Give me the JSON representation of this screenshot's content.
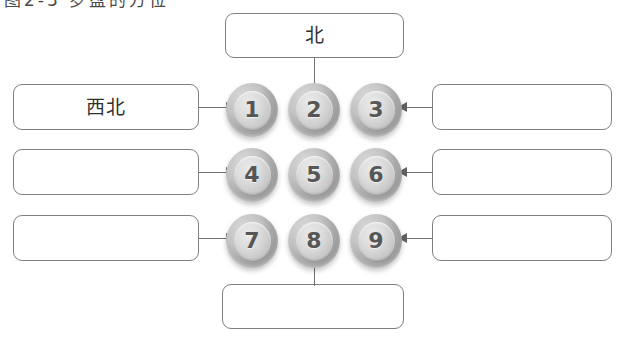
{
  "page": {
    "cut_off_header_text": "图2-3 罗盘的方位",
    "background_color": "#ffffff"
  },
  "colors": {
    "box_border": "#7d7f82",
    "connector": "#6f7173",
    "arrow_head": "#5f6163",
    "coin_outer": "#a8a8a8",
    "coin_inner": "#dcdcdc",
    "coin_number": "#565656",
    "text": "#2f2f2f"
  },
  "diagram": {
    "title": "",
    "type": "annotated-grid",
    "grid": {
      "rows": 3,
      "cols": 3,
      "cells": [
        {
          "id": "cell-1",
          "number": "1",
          "row": 1,
          "col": 1
        },
        {
          "id": "cell-2",
          "number": "2",
          "row": 1,
          "col": 2
        },
        {
          "id": "cell-3",
          "number": "3",
          "row": 1,
          "col": 3
        },
        {
          "id": "cell-4",
          "number": "4",
          "row": 2,
          "col": 1
        },
        {
          "id": "cell-5",
          "number": "5",
          "row": 2,
          "col": 2
        },
        {
          "id": "cell-6",
          "number": "6",
          "row": 2,
          "col": 3
        },
        {
          "id": "cell-7",
          "number": "7",
          "row": 3,
          "col": 1
        },
        {
          "id": "cell-8",
          "number": "8",
          "row": 3,
          "col": 2
        },
        {
          "id": "cell-9",
          "number": "9",
          "row": 3,
          "col": 3
        }
      ]
    },
    "callouts": [
      {
        "id": "callout-top",
        "label": "北",
        "position": "top",
        "target_number": "2",
        "arrow": "down"
      },
      {
        "id": "callout-left-1",
        "label": "西北",
        "position": "left-row-1",
        "target_number": "1",
        "arrow": "right"
      },
      {
        "id": "callout-left-2",
        "label": "",
        "position": "left-row-2",
        "target_number": "4",
        "arrow": "right"
      },
      {
        "id": "callout-left-3",
        "label": "",
        "position": "left-row-3",
        "target_number": "7",
        "arrow": "right"
      },
      {
        "id": "callout-right-1",
        "label": "",
        "position": "right-row-1",
        "target_number": "3",
        "arrow": "left"
      },
      {
        "id": "callout-right-2",
        "label": "",
        "position": "right-row-2",
        "target_number": "6",
        "arrow": "left"
      },
      {
        "id": "callout-right-3",
        "label": "",
        "position": "right-row-3",
        "target_number": "9",
        "arrow": "left"
      },
      {
        "id": "callout-bottom",
        "label": "",
        "position": "bottom",
        "target_number": "8",
        "arrow": "up"
      }
    ]
  }
}
